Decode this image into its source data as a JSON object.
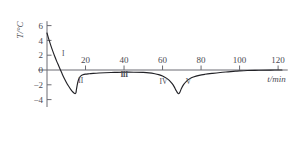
{
  "chart_data": {
    "type": "line",
    "title": "",
    "xlabel": "t/min",
    "ylabel": "T/°C",
    "xlim": [
      0,
      125
    ],
    "ylim": [
      -5,
      6.6
    ],
    "grid": false,
    "legend": "none",
    "xticks": [
      20,
      40,
      60,
      80,
      100,
      120
    ],
    "xtick_labels": [
      "20",
      "40",
      "60",
      "80",
      "100",
      "120"
    ],
    "yticks": [
      6,
      4,
      2,
      0,
      -2,
      -4
    ],
    "ytick_labels": [
      "6",
      "4",
      "2",
      "0",
      "−2",
      "−4"
    ],
    "series": [
      {
        "name": "cooling curve",
        "x": [
          0,
          1,
          2,
          3,
          4,
          5,
          6,
          7,
          8,
          9,
          10,
          11,
          12,
          13,
          14,
          14.6,
          15.0,
          15.3,
          15.7,
          16.2,
          16.8,
          17.6,
          18.6,
          20,
          22,
          24,
          27,
          30,
          35,
          40,
          45,
          50,
          53,
          56,
          58,
          60,
          62,
          63.5,
          65,
          66,
          67,
          67.8,
          68.4,
          69,
          69.8,
          71,
          72.5,
          74,
          76,
          79,
          82,
          86,
          90,
          94,
          98,
          100,
          104,
          110,
          116,
          122
        ],
        "y": [
          5.0,
          4.1,
          3.3,
          2.55,
          1.85,
          1.2,
          0.6,
          0.0,
          -0.6,
          -1.15,
          -1.65,
          -2.1,
          -2.5,
          -2.85,
          -3.1,
          -3.2,
          -3.1,
          -2.6,
          -2.0,
          -1.45,
          -1.05,
          -0.8,
          -0.65,
          -0.55,
          -0.5,
          -0.45,
          -0.4,
          -0.37,
          -0.33,
          -0.3,
          -0.3,
          -0.33,
          -0.38,
          -0.5,
          -0.62,
          -0.8,
          -1.1,
          -1.4,
          -1.85,
          -2.25,
          -2.75,
          -3.1,
          -3.2,
          -3.0,
          -2.5,
          -1.95,
          -1.5,
          -1.2,
          -0.95,
          -0.72,
          -0.58,
          -0.45,
          -0.34,
          -0.25,
          -0.16,
          -0.12,
          -0.07,
          -0.03,
          -0.01,
          0.0
        ]
      }
    ],
    "annotations": [
      {
        "label": "I",
        "x": 8.5,
        "y": 1.85
      },
      {
        "label": "II",
        "x": 17.5,
        "y": -1.75
      },
      {
        "label": "III",
        "x": 40.0,
        "y": -0.95
      },
      {
        "label": "IV",
        "x": 60.5,
        "y": -1.85
      },
      {
        "label": "V",
        "x": 73.5,
        "y": -1.85
      }
    ]
  },
  "colors": {
    "curve": "#222227",
    "axis": "#6b6b72",
    "text": "#4a4a52",
    "background": "#ffffff"
  }
}
